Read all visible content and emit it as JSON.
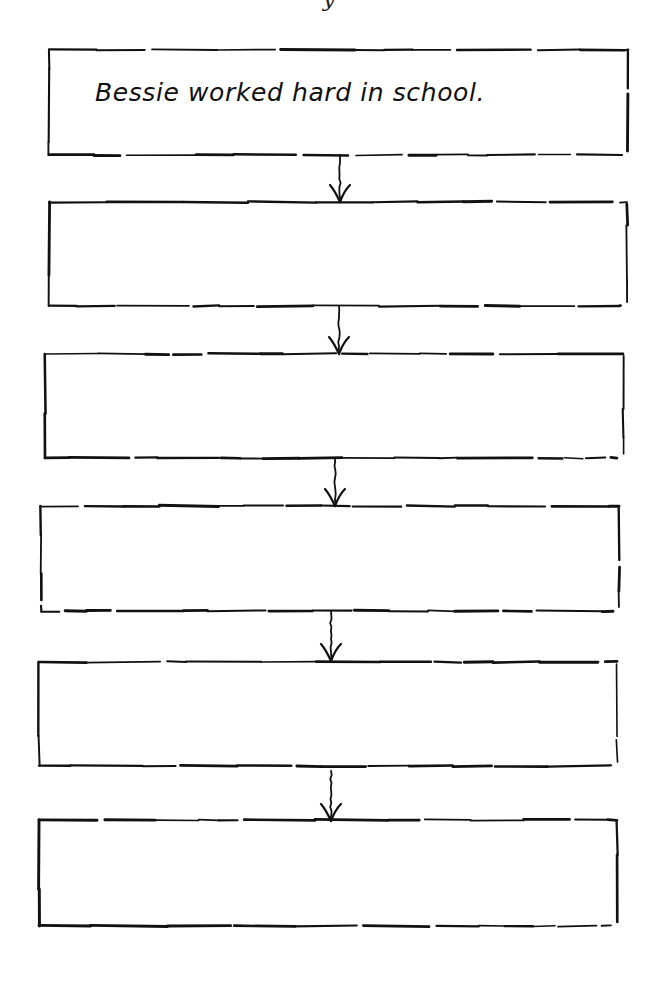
{
  "worksheet": {
    "title_fragment": "y",
    "boxes": [
      {
        "id": 1,
        "text": "Bessie worked hard in school.",
        "x": 49,
        "y": 50,
        "w": 579,
        "h": 105
      },
      {
        "id": 2,
        "text": "",
        "x": 49,
        "y": 202,
        "w": 578,
        "h": 104
      },
      {
        "id": 3,
        "text": "",
        "x": 45,
        "y": 354,
        "w": 578,
        "h": 104
      },
      {
        "id": 4,
        "text": "",
        "x": 41,
        "y": 506,
        "w": 578,
        "h": 105
      },
      {
        "id": 5,
        "text": "",
        "x": 39,
        "y": 662,
        "w": 578,
        "h": 104
      },
      {
        "id": 6,
        "text": "",
        "x": 39,
        "y": 820,
        "w": 578,
        "h": 106
      }
    ],
    "arrows": [
      {
        "from": 1,
        "to": 2,
        "x": 340,
        "y1": 155,
        "y2": 203,
        "icon": "arrow-down-icon"
      },
      {
        "from": 2,
        "to": 3,
        "x": 339,
        "y1": 306,
        "y2": 355,
        "icon": "arrow-down-icon"
      },
      {
        "from": 3,
        "to": 4,
        "x": 335,
        "y1": 458,
        "y2": 507,
        "icon": "arrow-down-icon"
      },
      {
        "from": 4,
        "to": 5,
        "x": 331,
        "y1": 611,
        "y2": 662,
        "icon": "arrow-down-icon"
      },
      {
        "from": 5,
        "to": 6,
        "x": 331,
        "y1": 771,
        "y2": 822,
        "icon": "arrow-down-icon"
      }
    ],
    "colors": {
      "ink": "#111111",
      "paper": "#ffffff"
    }
  }
}
